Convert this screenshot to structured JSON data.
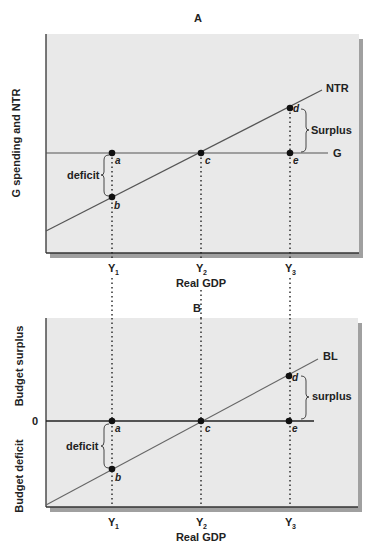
{
  "panel_a": {
    "title": "A",
    "y_axis_label": "G spending and NTR",
    "x_axis_label": "Real GDP",
    "x_ticks": [
      {
        "main": "Y",
        "sub": "1"
      },
      {
        "main": "Y",
        "sub": "2"
      },
      {
        "main": "Y",
        "sub": "3"
      }
    ],
    "lines": {
      "ntr": "NTR",
      "g": "G"
    },
    "points": {
      "a": "a",
      "b": "b",
      "c": "c",
      "d": "d",
      "e": "e"
    },
    "brackets": {
      "deficit": "deficit",
      "surplus": "Surplus"
    }
  },
  "panel_b": {
    "title": "B",
    "y_axis_label_top": "Budget surplus",
    "y_axis_label_bottom": "Budget deficit",
    "zero_label": "0",
    "x_axis_label": "Real GDP",
    "x_ticks": [
      {
        "main": "Y",
        "sub": "1"
      },
      {
        "main": "Y",
        "sub": "2"
      },
      {
        "main": "Y",
        "sub": "3"
      }
    ],
    "lines": {
      "bl": "BL"
    },
    "points": {
      "a": "a",
      "b": "b",
      "c": "c",
      "d": "d",
      "e": "e"
    },
    "brackets": {
      "deficit": "deficit",
      "surplus": "surplus"
    }
  },
  "colors": {
    "panel_fill": "#e9e9e9",
    "shadow": "#9a9a9a",
    "axis": "#333333",
    "line": "#555555",
    "point": "#111111"
  }
}
